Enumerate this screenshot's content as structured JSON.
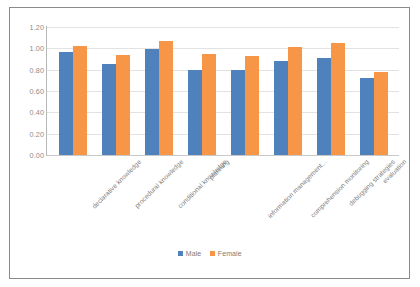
{
  "chart_data": {
    "type": "bar",
    "title": "",
    "xlabel": "",
    "ylabel": "",
    "ylim": [
      0,
      1.2
    ],
    "ytick_step": 0.2,
    "ytick_labels": [
      "1.20",
      "1.00",
      "0.80",
      "0.60",
      "0.40",
      "0.20",
      "0.00"
    ],
    "grid": true,
    "legend_position": "bottom-center",
    "categories": [
      "declarative knowledge",
      "procedural knowledge",
      "conditional knowledge",
      "planning",
      "information management...",
      "comprehension monitoring",
      "debugging strategies",
      "evaluation"
    ],
    "series": [
      {
        "name": "Male",
        "color": "#4f81bd",
        "values": [
          0.97,
          0.85,
          0.99,
          0.8,
          0.8,
          0.88,
          0.91,
          0.72
        ]
      },
      {
        "name": "Female",
        "color": "#f79646",
        "values": [
          1.02,
          0.94,
          1.07,
          0.95,
          0.93,
          1.01,
          1.05,
          0.78
        ]
      }
    ]
  },
  "legend": {
    "items": [
      {
        "label": "Male",
        "color": "#4f81bd"
      },
      {
        "label": "Female",
        "color": "#f79646"
      }
    ]
  }
}
